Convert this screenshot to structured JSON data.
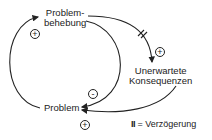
{
  "nodes": {
    "problembehebung": {
      "line1": "Problem-",
      "line2": "behebung"
    },
    "konsequenzen": {
      "line1": "Unerwartete",
      "line2": "Konsequenzen"
    },
    "problem": {
      "label": "Problem"
    }
  },
  "links": [
    {
      "from": "Problem",
      "to": "Problembehebung",
      "polarity": "+"
    },
    {
      "from": "Problembehebung",
      "to": "Problem",
      "polarity": "-"
    },
    {
      "from": "Problembehebung",
      "to": "Unerwartete Konsequenzen",
      "polarity": "+",
      "delay": true
    },
    {
      "from": "Unerwartete Konsequenzen",
      "to": "Problem",
      "polarity": "+"
    }
  ],
  "signs": {
    "s1": "+",
    "s2": "-",
    "s3": "+",
    "s4": "+"
  },
  "legend": {
    "symbol": "II",
    "text": "= Verzögerung"
  }
}
